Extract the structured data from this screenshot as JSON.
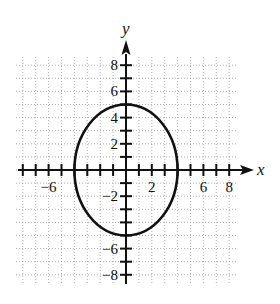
{
  "chart_data": {
    "type": "line",
    "title": "",
    "xlabel": "x",
    "ylabel": "y",
    "xlim": [
      -8.5,
      8.5
    ],
    "ylim": [
      -8.8,
      8.8
    ],
    "grid": true,
    "grid_style": "dotted",
    "x_tick_labels": [
      "-6",
      "2",
      "6",
      "8"
    ],
    "x_tick_values": [
      -6,
      2,
      6,
      8
    ],
    "y_tick_labels": [
      "8",
      "6",
      "4",
      "2",
      "-2",
      "-6",
      "-8"
    ],
    "y_tick_values": [
      8,
      6,
      4,
      2,
      -2,
      -6,
      -8
    ],
    "ticks_every": 1,
    "series": [
      {
        "name": "ellipse",
        "equation": "x^2/16 + y^2/25 = 1",
        "center": [
          0,
          0
        ],
        "semi_axis_x": 4,
        "semi_axis_y": 5,
        "intercepts": {
          "x": [
            -4,
            4
          ],
          "y": [
            -5,
            5
          ]
        },
        "color": "#111111"
      }
    ]
  },
  "labels": {
    "x_axis": "x",
    "y_axis": "y"
  },
  "colors": {
    "axis": "#111111",
    "grid": "#9a9a9a",
    "curve": "#111111"
  }
}
